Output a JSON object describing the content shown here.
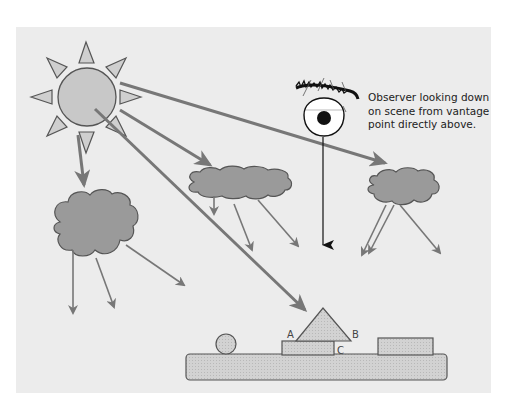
{
  "diagram": {
    "title": "",
    "observer_caption": [
      "Observer looking down",
      "on scene from vantage",
      "point directly above."
    ],
    "labels": {
      "a": "A",
      "b": "B",
      "c": "C"
    },
    "elements": {
      "light_source": "sun",
      "viewer": "eye",
      "clouds": 3,
      "scene_objects": [
        "sphere",
        "pyramid",
        "box-under-pyramid",
        "box-right",
        "ground-slab"
      ]
    },
    "colors": {
      "panel": "#ececec",
      "sun_fill": "#c8c8c8",
      "cloud_fill": "#9a9a9a",
      "ray": "#777777",
      "outline": "#555555",
      "object_fill": "#cfcfcf"
    }
  }
}
